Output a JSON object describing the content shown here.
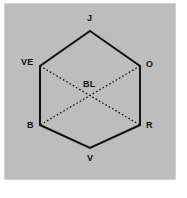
{
  "figure": {
    "type": "color-hexagon-diagram",
    "panel_background": "#bdbdbd",
    "page_background": "#ffffff",
    "stroke_color": "#111111",
    "diagonal_style": "dotted"
  },
  "vertices": [
    {
      "id": "J",
      "label": "J",
      "position": "top",
      "x": 90,
      "y": 31
    },
    {
      "id": "O",
      "label": "O",
      "position": "upper-right",
      "x": 140,
      "y": 66
    },
    {
      "id": "R",
      "label": "R",
      "position": "lower-right",
      "x": 140,
      "y": 125
    },
    {
      "id": "V",
      "label": "V",
      "position": "bottom",
      "x": 90,
      "y": 148
    },
    {
      "id": "B",
      "label": "B",
      "position": "lower-left",
      "x": 40,
      "y": 125
    },
    {
      "id": "VE",
      "label": "VE",
      "position": "upper-left",
      "x": 40,
      "y": 66
    }
  ],
  "center": {
    "id": "BL",
    "label": "BL",
    "x": 90,
    "y": 95
  },
  "edges": [
    {
      "from": "VE",
      "to": "J",
      "style": "solid"
    },
    {
      "from": "J",
      "to": "O",
      "style": "solid"
    },
    {
      "from": "O",
      "to": "R",
      "style": "solid"
    },
    {
      "from": "R",
      "to": "V",
      "style": "solid"
    },
    {
      "from": "V",
      "to": "B",
      "style": "solid"
    },
    {
      "from": "B",
      "to": "VE",
      "style": "solid"
    }
  ],
  "diagonals": [
    {
      "from": "VE",
      "to": "R",
      "style": "dotted"
    },
    {
      "from": "O",
      "to": "B",
      "style": "dotted"
    }
  ]
}
